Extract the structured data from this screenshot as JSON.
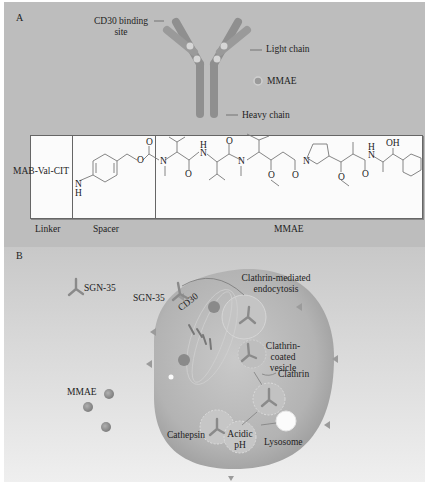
{
  "panel_a": {
    "label": "A",
    "antibody": {
      "callouts": {
        "binding_site": [
          "CD30 binding",
          "site"
        ],
        "light_chain": "Light chain",
        "mmae": "MMAE",
        "heavy_chain": "Heavy chain"
      }
    },
    "structure": {
      "linker_text": "MAB-Val-CIT",
      "atoms": {
        "nh_n": "N",
        "nh_h": "H",
        "o": "O",
        "n": "N",
        "h": "H",
        "oh": "OH"
      },
      "section_labels": {
        "linker": "Linker",
        "spacer": "Spacer",
        "mmae": "MMAE"
      }
    }
  },
  "panel_b": {
    "label": "B",
    "labels": {
      "sgn35_free": "SGN-35",
      "sgn35_bound": "SGN-35",
      "cd30": "CD30",
      "endocytosis": [
        "Clathrin-mediated",
        "endocytosis"
      ],
      "coated_vesicle": [
        "Clathrin-",
        "coated",
        "vesicle"
      ],
      "clathrin": "Clathrin",
      "mmae": "MMAE",
      "cathepsin": "Cathepsin",
      "acidic_ph": [
        "Acidic",
        "pH"
      ],
      "lysosome": "Lysosome"
    }
  },
  "colors": {
    "panel_a_bg": "#bdbdbd",
    "panel_b_bg": "#d8d8d8",
    "antibody": "#8f8f8f",
    "cell": "#aaaaaa",
    "mmae_dot": "#8a8a8a"
  }
}
